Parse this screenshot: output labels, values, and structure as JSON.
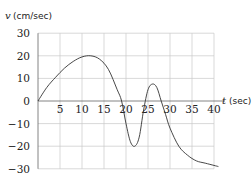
{
  "chart_data": {
    "type": "line",
    "title": "",
    "xlabel": "t (sec)",
    "ylabel": "v (cm/sec)",
    "xlabel_var": "t",
    "xlabel_unit": "(sec)",
    "ylabel_var": "v",
    "ylabel_unit": "(cm/sec)",
    "xlim": [
      0,
      40
    ],
    "ylim": [
      -30,
      30
    ],
    "grid": true,
    "x_ticks": [
      "5",
      "10",
      "15",
      "20",
      "25",
      "30",
      "35",
      "40"
    ],
    "y_ticks": [
      "30",
      "20",
      "10",
      "0",
      "−10",
      "−20",
      "−30"
    ],
    "series": [
      {
        "name": "v(t)",
        "x": [
          0,
          2,
          4,
          6,
          8,
          10,
          12,
          14,
          16,
          18,
          19,
          20,
          21,
          22,
          23,
          24,
          25,
          26,
          27,
          28,
          29,
          30,
          32,
          34,
          36,
          38,
          40,
          41
        ],
        "y": [
          0,
          6,
          10.5,
          14.5,
          17.5,
          19.5,
          20,
          18.5,
          14,
          5,
          0,
          -10,
          -18,
          -20,
          -16,
          -4,
          5,
          7.5,
          6,
          0,
          -6,
          -12,
          -20,
          -24,
          -26.5,
          -27.5,
          -28.5,
          -29
        ]
      }
    ]
  }
}
